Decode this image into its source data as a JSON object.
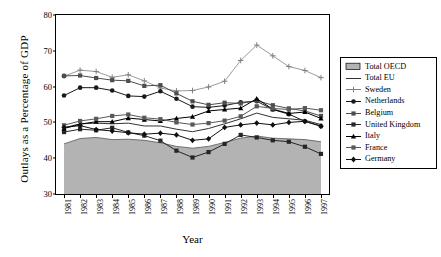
{
  "chart_data": {
    "type": "line",
    "title": "",
    "xlabel": "Year",
    "ylabel": "Outlays as a Percentage of GDP",
    "ylim": [
      30,
      80
    ],
    "yticks": [
      30,
      40,
      50,
      60,
      70,
      80
    ],
    "grid": false,
    "legend_position": "right",
    "categories": [
      "1981",
      "1982",
      "1983",
      "1984",
      "1985",
      "1986",
      "1987",
      "1988",
      "1989",
      "1990",
      "1991",
      "1992",
      "1993",
      "1994",
      "1995",
      "1996",
      "1997"
    ],
    "series": [
      {
        "name": "Total OECD",
        "marker": "filled-area",
        "style": "area",
        "color": "#b3b3b3",
        "values": [
          44.0,
          45.5,
          45.8,
          45.2,
          45.3,
          45.0,
          44.3,
          43.3,
          42.8,
          43.3,
          44.4,
          45.6,
          46.2,
          45.6,
          45.4,
          45.2,
          44.6
        ]
      },
      {
        "name": "Total EU",
        "marker": "line-plain",
        "style": "line",
        "color": "#333333",
        "values": [
          48.5,
          49.6,
          49.8,
          49.6,
          49.8,
          49.0,
          49.0,
          48.1,
          47.4,
          48.3,
          49.6,
          51.0,
          52.6,
          51.4,
          51.0,
          50.6,
          49.4
        ]
      },
      {
        "name": "Sweden",
        "marker": "plus",
        "style": "line",
        "color": "#808080",
        "values": [
          62.9,
          64.6,
          64.2,
          62.6,
          63.3,
          61.6,
          59.6,
          58.8,
          58.9,
          59.9,
          61.5,
          67.3,
          71.6,
          68.6,
          65.6,
          64.5,
          62.5
        ]
      },
      {
        "name": "Netherlands",
        "marker": "circle",
        "style": "line",
        "color": "#1a1a1a",
        "values": [
          57.5,
          59.7,
          59.7,
          58.9,
          57.4,
          57.2,
          58.7,
          56.6,
          54.4,
          54.2,
          54.7,
          55.6,
          55.9,
          53.6,
          52.3,
          50.3,
          48.9
        ]
      },
      {
        "name": "Belgium",
        "marker": "square",
        "style": "line",
        "color": "#4d4d4d",
        "values": [
          63.0,
          63.1,
          62.4,
          61.8,
          61.6,
          60.2,
          60.4,
          58.1,
          55.9,
          54.9,
          55.5,
          55.3,
          56.1,
          54.8,
          53.9,
          53.2,
          51.8
        ]
      },
      {
        "name": "United Kingdom",
        "marker": "square",
        "style": "line",
        "color": "#262626",
        "values": [
          47.3,
          48.1,
          47.8,
          48.5,
          47.2,
          46.3,
          44.9,
          42.1,
          40.2,
          41.7,
          44.0,
          46.5,
          45.8,
          45.0,
          44.6,
          43.2,
          41.2
        ]
      },
      {
        "name": "Italy",
        "marker": "triangle",
        "style": "line",
        "color": "#000000",
        "values": [
          48.3,
          49.5,
          50.2,
          50.2,
          51.2,
          50.8,
          50.4,
          51.1,
          51.6,
          53.2,
          53.6,
          54.0,
          56.6,
          53.7,
          52.5,
          52.9,
          51.1
        ]
      },
      {
        "name": "France",
        "marker": "square",
        "style": "line",
        "color": "#595959",
        "values": [
          49.2,
          50.4,
          51.0,
          51.8,
          52.2,
          51.3,
          50.9,
          50.0,
          49.4,
          49.8,
          50.5,
          51.7,
          54.5,
          53.9,
          53.6,
          54.0,
          53.4
        ]
      },
      {
        "name": "Germany",
        "marker": "diamond",
        "style": "line",
        "color": "#111111",
        "values": [
          48.6,
          49.1,
          48.0,
          47.6,
          47.1,
          46.7,
          47.0,
          46.5,
          45.0,
          45.4,
          48.6,
          49.3,
          49.8,
          49.3,
          50.0,
          50.3,
          49.0
        ]
      }
    ]
  },
  "axes": {
    "x_title": "Year",
    "y_title": "Outlays as a Percentage of GDP"
  }
}
